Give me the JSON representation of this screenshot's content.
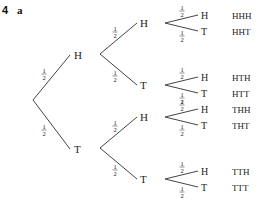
{
  "question": {
    "number": "4",
    "part": "a"
  },
  "tree": {
    "branch_probability": {
      "numerator": "1",
      "denominator": "2"
    },
    "level1": [
      {
        "label": "H",
        "prob": "1/2",
        "children": [
          {
            "label": "H",
            "prob": "1/2",
            "children": [
              {
                "label": "H",
                "prob": "1/2",
                "outcome": "HHH"
              },
              {
                "label": "T",
                "prob": "1/2",
                "outcome": "HHT"
              }
            ]
          },
          {
            "label": "T",
            "prob": "1/2",
            "children": [
              {
                "label": "H",
                "prob": "1/2",
                "outcome": "HTH"
              },
              {
                "label": "T",
                "prob": "1/2",
                "outcome": "HTT"
              }
            ]
          }
        ]
      },
      {
        "label": "T",
        "prob": "1/2",
        "children": [
          {
            "label": "H",
            "prob": "1/2",
            "children": [
              {
                "label": "H",
                "prob": "1/2",
                "outcome": "THH"
              },
              {
                "label": "T",
                "prob": "1/2",
                "outcome": "THT"
              }
            ]
          },
          {
            "label": "T",
            "prob": "1/2",
            "children": [
              {
                "label": "H",
                "prob": "1/2",
                "outcome": "TTH"
              },
              {
                "label": "T",
                "prob": "1/2",
                "outcome": "TTT"
              }
            ]
          }
        ]
      }
    ]
  }
}
